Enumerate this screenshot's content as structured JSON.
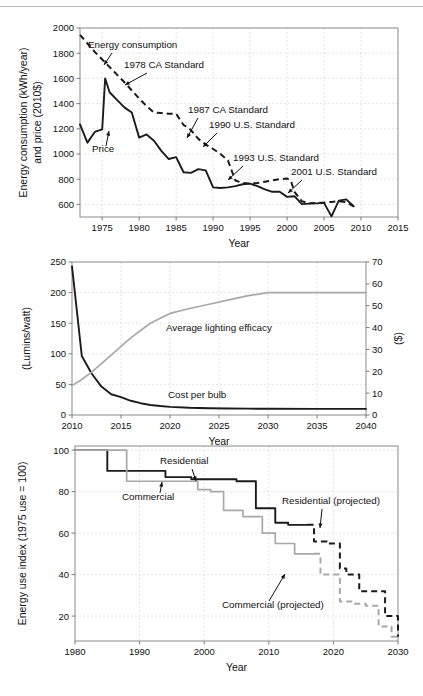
{
  "figure": {
    "name": "three-panel-lighting-and-energy-figure",
    "width": 423,
    "height": 696,
    "background": "#ffffff",
    "colors": {
      "dark_series": "#1b1b1b",
      "light_series": "#a8a8a8",
      "frame": "#8a8a8a",
      "grid": "#d8d8d8",
      "text": "#111111"
    }
  },
  "chart_data": [
    {
      "id": "panel-top",
      "type": "line",
      "title": "",
      "xlabel": "Year",
      "ylabel": "Energy consumption (kWh/year)\nand price (2010$)",
      "ylabel_line1": "Energy consumption (kWh/year)",
      "ylabel_line2": "and price (2010$)",
      "xlim": [
        1972,
        2015
      ],
      "ylim": [
        500,
        2000
      ],
      "xticks": [
        1975,
        1980,
        1985,
        1990,
        1995,
        2000,
        2005,
        2010,
        2015
      ],
      "yticks": [
        600,
        800,
        1000,
        1200,
        1400,
        1600,
        1800,
        2000
      ],
      "grid": true,
      "legend": "none",
      "series": [
        {
          "name": "Energy consumption",
          "style": "dashed",
          "color": "#1b1b1b",
          "x": [
            1972,
            1974,
            1976,
            1978,
            1980,
            1981,
            1982,
            1983,
            1984,
            1985,
            1986,
            1986.5,
            1987,
            1988,
            1989,
            1990,
            1991,
            1992,
            1992.5,
            1993,
            1994,
            1995,
            1996,
            1997,
            1998,
            1999,
            2000,
            2000.5,
            2001,
            2002,
            2003,
            2004,
            2005,
            2006,
            2007,
            2008,
            2009
          ],
          "y": [
            1945,
            1810,
            1690,
            1570,
            1440,
            1380,
            1330,
            1325,
            1320,
            1320,
            1230,
            1215,
            1190,
            1120,
            1075,
            1040,
            1000,
            950,
            870,
            790,
            770,
            765,
            770,
            780,
            790,
            800,
            805,
            790,
            700,
            625,
            610,
            612,
            615,
            620,
            625,
            618,
            585
          ]
        },
        {
          "name": "Price",
          "style": "solid",
          "color": "#1b1b1b",
          "x": [
            1972,
            1973,
            1974,
            1975,
            1975.4,
            1976,
            1977,
            1978,
            1979,
            1980,
            1981,
            1982,
            1983,
            1984,
            1985,
            1986,
            1987,
            1988,
            1989,
            1990,
            1991,
            1992,
            1993,
            1994,
            1995,
            1996,
            1997,
            1998,
            1999,
            2000,
            2001,
            2002,
            2003,
            2004,
            2005,
            2006,
            2007,
            2008,
            2009
          ],
          "y": [
            1235,
            1090,
            1175,
            1195,
            1600,
            1490,
            1430,
            1370,
            1330,
            1130,
            1155,
            1105,
            1025,
            960,
            975,
            855,
            850,
            880,
            870,
            735,
            730,
            735,
            745,
            760,
            765,
            745,
            720,
            700,
            700,
            660,
            665,
            602,
            606,
            608,
            612,
            505,
            630,
            640,
            585
          ]
        }
      ],
      "annotations": [
        {
          "text": "Energy consumption",
          "x_px": 88,
          "y_px": 48,
          "anchor": "start",
          "leader": {
            "x1": 112,
            "y1": 53,
            "x2": 104,
            "y2": 65
          }
        },
        {
          "text": "1978 CA Standard",
          "x_px": 124,
          "y_px": 68,
          "anchor": "start",
          "leader": {
            "x1": 147,
            "y1": 73,
            "x2": 125,
            "y2": 85
          }
        },
        {
          "text": "1987 CA Standard",
          "x_px": 188,
          "y_px": 113,
          "anchor": "start",
          "leader": {
            "x1": 198,
            "y1": 118,
            "x2": 187,
            "y2": 138
          }
        },
        {
          "text": "1990 U.S. Standard",
          "x_px": 209,
          "y_px": 128,
          "anchor": "start",
          "leader": {
            "x1": 217,
            "y1": 133,
            "x2": 203,
            "y2": 147
          }
        },
        {
          "text": "1993 U.S. Standard",
          "x_px": 233,
          "y_px": 161,
          "anchor": "start",
          "leader": {
            "x1": 243,
            "y1": 166,
            "x2": 228,
            "y2": 180
          }
        },
        {
          "text": "2001 U.S. Standard",
          "x_px": 291,
          "y_px": 175,
          "anchor": "start",
          "leader": {
            "x1": 302,
            "y1": 180,
            "x2": 288,
            "y2": 193
          }
        },
        {
          "text": "Price",
          "x_px": 92,
          "y_px": 152,
          "anchor": "start",
          "leader": {
            "x1": 106,
            "y1": 146,
            "x2": 109,
            "y2": 131
          }
        }
      ]
    },
    {
      "id": "panel-middle",
      "type": "line",
      "title": "",
      "xlabel": "Year",
      "ylabel": "(Lumins/watt)",
      "ylabel_right": "($)",
      "xlim": [
        2010,
        2040
      ],
      "ylim": [
        0,
        250
      ],
      "ylim_right": [
        0,
        70
      ],
      "xticks": [
        2010,
        2015,
        2020,
        2025,
        2030,
        2035,
        2040
      ],
      "yticks": [
        0,
        50,
        100,
        150,
        200,
        250
      ],
      "yticks_right": [
        0,
        10,
        20,
        30,
        40,
        50,
        60,
        70
      ],
      "grid": true,
      "legend": "none",
      "series": [
        {
          "name": "Cost per bulb",
          "axis": "right",
          "style": "solid",
          "color": "#1b1b1b",
          "x": [
            2010,
            2011,
            2012,
            2013,
            2014,
            2015,
            2016,
            2017,
            2018,
            2019,
            2020,
            2022,
            2024,
            2026,
            2028,
            2030,
            2035,
            2040
          ],
          "y": [
            68,
            27,
            19,
            13,
            9.5,
            8.2,
            6.5,
            5.4,
            4.6,
            4.1,
            3.7,
            3.3,
            3.1,
            3.0,
            2.9,
            2.85,
            2.8,
            2.8
          ]
        },
        {
          "name": "Average lighting efficacy",
          "axis": "left",
          "style": "solid",
          "color": "#a8a8a8",
          "x": [
            2010,
            2011,
            2012,
            2013,
            2014,
            2015,
            2016,
            2017,
            2018,
            2019,
            2020,
            2022,
            2024,
            2026,
            2028,
            2030,
            2035,
            2040
          ],
          "y": [
            48,
            58,
            70,
            84,
            98,
            112,
            126,
            138,
            150,
            158,
            166,
            174,
            181,
            188,
            195,
            200,
            200,
            200
          ]
        }
      ],
      "annotations": [
        {
          "text": "Average lighting efficacy",
          "x_px": 166,
          "y_px": 331,
          "anchor": "start"
        },
        {
          "text": "Cost per bulb",
          "x_px": 168,
          "y_px": 398,
          "anchor": "start"
        }
      ]
    },
    {
      "id": "panel-bottom",
      "type": "line",
      "title": "",
      "xlabel": "Year",
      "ylabel": "Energy use index (1975 use = 100)",
      "xlim": [
        1980,
        2030
      ],
      "ylim": [
        8,
        102
      ],
      "xticks": [
        1980,
        1990,
        2000,
        2010,
        2020,
        2030
      ],
      "yticks": [
        20,
        40,
        60,
        80,
        100
      ],
      "grid": true,
      "legend": "none",
      "series": [
        {
          "name": "Residential",
          "style": "solid",
          "color": "#1b1b1b",
          "x": [
            1980,
            1984,
            1985,
            1985,
            1991,
            1991,
            1994,
            1994,
            1998,
            1998,
            2005,
            2005,
            2008,
            2008,
            2011,
            2011,
            2013,
            2013,
            2016
          ],
          "y": [
            100,
            100,
            100,
            90,
            90,
            90,
            90,
            87,
            87,
            86,
            86,
            85,
            85,
            72,
            72,
            65,
            65,
            64,
            64
          ]
        },
        {
          "name": "Residential (projected)",
          "style": "dashed",
          "color": "#1b1b1b",
          "x": [
            2016,
            2017,
            2017,
            2019,
            2019,
            2021,
            2021,
            2022,
            2022,
            2024,
            2024,
            2026,
            2026,
            2028,
            2028,
            2030,
            2030
          ],
          "y": [
            64,
            64,
            56,
            56,
            55,
            55,
            43,
            43,
            40,
            40,
            32,
            32,
            32,
            32,
            20,
            20,
            10
          ]
        },
        {
          "name": "Commercial",
          "style": "solid",
          "color": "#a8a8a8",
          "x": [
            1980,
            1988,
            1988,
            1994,
            1994,
            1999,
            1999,
            2001,
            2001,
            2003,
            2003,
            2006,
            2006,
            2009,
            2009,
            2011,
            2011,
            2014,
            2014,
            2017
          ],
          "y": [
            100,
            100,
            85,
            85,
            85,
            85,
            81,
            81,
            80,
            80,
            71,
            71,
            68,
            68,
            60,
            60,
            55,
            55,
            50,
            50
          ]
        },
        {
          "name": "Commercial (projected)",
          "style": "dashed",
          "color": "#a8a8a8",
          "x": [
            2017,
            2018,
            2018,
            2020,
            2020,
            2021,
            2021,
            2023,
            2023,
            2025,
            2025,
            2027,
            2027,
            2029,
            2029,
            2030
          ],
          "y": [
            50,
            50,
            40,
            40,
            40,
            40,
            27,
            27,
            26,
            26,
            25,
            25,
            15,
            15,
            10,
            10
          ]
        }
      ],
      "annotations": [
        {
          "text": "Residential",
          "x_px": 160,
          "y_px": 464,
          "anchor": "start",
          "leader": {
            "x1": 192,
            "y1": 469,
            "x2": 196,
            "y2": 481
          }
        },
        {
          "text": "Commercial",
          "x_px": 122,
          "y_px": 500,
          "anchor": "start",
          "leader": {
            "x1": 160,
            "y1": 493,
            "x2": 162,
            "y2": 482
          }
        },
        {
          "text": "Residential (projected)",
          "x_px": 282,
          "y_px": 504,
          "anchor": "start",
          "leader": {
            "x1": 322,
            "y1": 509,
            "x2": 320,
            "y2": 528
          }
        },
        {
          "text": "Commercial (projected)",
          "x_px": 222,
          "y_px": 608,
          "anchor": "start",
          "leader": {
            "x1": 269,
            "y1": 601,
            "x2": 285,
            "y2": 574
          }
        }
      ]
    }
  ]
}
